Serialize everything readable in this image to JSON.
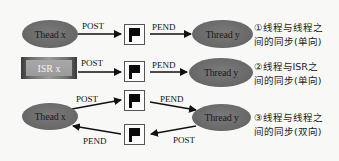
{
  "diagram": {
    "rows": [
      {
        "source": "Thead x",
        "source_shape": "ellipse",
        "post_label": "POST",
        "pend_label": "PEND",
        "target": "Thread y",
        "description_line1": "①线程与线程之",
        "description_line2": "间的同步(单向)"
      },
      {
        "source": "ISR x",
        "source_shape": "rectangle",
        "post_label": "POST",
        "pend_label": "PEND",
        "target": "Thread y",
        "description_line1": "②线程与ISR之",
        "description_line2": "间的同步(单向)"
      },
      {
        "source": "Thead x",
        "source_shape": "ellipse",
        "post_label_top": "POST",
        "pend_label_top": "PEND",
        "pend_label_bottom": "PEND",
        "post_label_bottom": "POST",
        "target": "Thread y",
        "description_line1": "③线程与线程之",
        "description_line2": "间的同步(双向)"
      }
    ],
    "icons": {
      "semaphore": "flag-icon"
    },
    "colors": {
      "node_fill": "#6e6e6e",
      "arrow": "#111111",
      "background": "#f8f8f6"
    }
  }
}
